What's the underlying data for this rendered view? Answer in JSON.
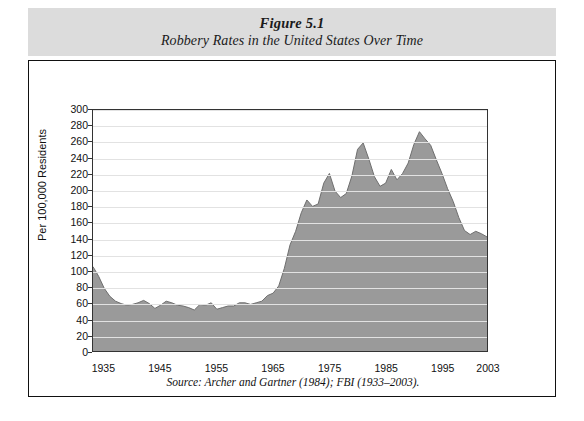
{
  "figure": {
    "number": "Figure 5.1",
    "title": "Robbery Rates in the United States Over Time",
    "source": "Source: Archer and Gartner (1984); FBI (1933–2003)."
  },
  "colors": {
    "band": "#dcdcdc",
    "area_fill": "#9a9a9a",
    "area_stroke": "#6e6e6e",
    "grid": "#e2e2e2",
    "axis": "#333333",
    "text": "#111111"
  },
  "chart_data": {
    "type": "area",
    "title": "Robbery Rates in the United States Over Time",
    "subtitle": "Figure 5.1",
    "xlabel": "",
    "ylabel": "Per 100,000 Residents",
    "xlim": [
      1933,
      2003
    ],
    "ylim": [
      0,
      300
    ],
    "ytick_step": 20,
    "grid": true,
    "legend": "none",
    "xticks": [
      1935,
      1945,
      1955,
      1965,
      1975,
      1985,
      1995,
      2003
    ],
    "yticks": [
      0,
      20,
      40,
      60,
      80,
      100,
      120,
      140,
      160,
      180,
      200,
      220,
      240,
      260,
      280,
      300
    ],
    "series": [
      {
        "name": "Robbery rate per 100,000 residents",
        "x": [
          1933,
          1934,
          1935,
          1936,
          1937,
          1938,
          1939,
          1940,
          1941,
          1942,
          1943,
          1944,
          1945,
          1946,
          1947,
          1948,
          1949,
          1950,
          1951,
          1952,
          1953,
          1954,
          1955,
          1956,
          1957,
          1958,
          1959,
          1960,
          1961,
          1962,
          1963,
          1964,
          1965,
          1966,
          1967,
          1968,
          1969,
          1970,
          1971,
          1972,
          1973,
          1974,
          1975,
          1976,
          1977,
          1978,
          1979,
          1980,
          1981,
          1982,
          1983,
          1984,
          1985,
          1986,
          1987,
          1988,
          1989,
          1990,
          1991,
          1992,
          1993,
          1994,
          1995,
          1996,
          1997,
          1998,
          1999,
          2000,
          2001,
          2002,
          2003
        ],
        "values": [
          105,
          93,
          78,
          68,
          62,
          59,
          57,
          58,
          60,
          63,
          59,
          53,
          57,
          62,
          60,
          57,
          56,
          54,
          51,
          58,
          57,
          60,
          52,
          54,
          56,
          56,
          60,
          60,
          58,
          60,
          62,
          69,
          72,
          81,
          103,
          132,
          149,
          172,
          188,
          180,
          183,
          209,
          221,
          199,
          191,
          196,
          218,
          251,
          259,
          239,
          217,
          205,
          209,
          226,
          213,
          221,
          234,
          257,
          273,
          264,
          256,
          238,
          221,
          202,
          186,
          166,
          150,
          145,
          149,
          146,
          142
        ]
      }
    ],
    "annotations": [
      {
        "label": "start 1933",
        "value": 105
      },
      {
        "label": "postwar low mid-1950s",
        "value": 52
      },
      {
        "label": "peak 1991",
        "value": 273
      },
      {
        "label": "end 2003",
        "value": 142
      }
    ]
  }
}
